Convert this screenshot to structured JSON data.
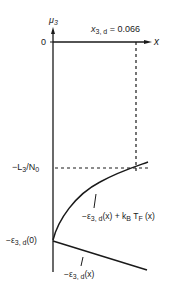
{
  "diagram": {
    "y_axis_label": {
      "symbol": "μ",
      "sub": "3"
    },
    "x_axis_label": "x",
    "x_marker": {
      "symbol": "x",
      "sub": "3, d",
      "value": "= 0.066"
    },
    "tick_zero": "0",
    "level_label": {
      "prefix": "−L",
      "sub": "3",
      "suffix": "/N",
      "sub2": "0"
    },
    "intercept_label": {
      "prefix": "−ε",
      "sub": "3, d",
      "suffix": "(0)"
    },
    "upper_curve_label": {
      "prefix": "−ε",
      "sub": "3, d",
      "mid": "(x) + k",
      "sub2": "B",
      "mid2": " T",
      "sub3": "F",
      "suffix": " (x)"
    },
    "lower_line_label": {
      "prefix": "−ε",
      "sub": "3, d",
      "suffix": "(x)"
    },
    "colors": {
      "ink": "#1a1a1a",
      "background": "#ffffff"
    }
  }
}
